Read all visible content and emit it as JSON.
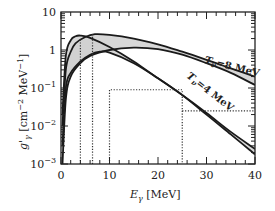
{
  "chart_data": {
    "type": "line",
    "title": "",
    "xlabel": "E_γ [MeV]",
    "ylabel": "g'_γ [cm^-2 MeV^-1]",
    "xlim": [
      0,
      40
    ],
    "ylim": [
      0.001,
      10
    ],
    "yscale": "log",
    "grid": false,
    "legend": "none (inline band labels)",
    "x_ticks": [
      "0",
      "10",
      "20",
      "30",
      "40"
    ],
    "y_ticks": [
      "10^-3",
      "10^-2",
      "10^-1",
      "1",
      "10"
    ],
    "series": [
      {
        "name": "T_ν=8 MeV band",
        "label": "T_ν=8 MeV",
        "fill": "#d0d0d0",
        "upper": [
          [
            0.3,
            0.01
          ],
          [
            1,
            0.3
          ],
          [
            2,
            0.9
          ],
          [
            3,
            1.5
          ],
          [
            5,
            2.2
          ],
          [
            7,
            2.6
          ],
          [
            10,
            2.5
          ],
          [
            15,
            2.0
          ],
          [
            20,
            1.4
          ],
          [
            25,
            0.9
          ],
          [
            30,
            0.55
          ],
          [
            35,
            0.33
          ],
          [
            40,
            0.2
          ]
        ],
        "lower": [
          [
            0.3,
            0.001
          ],
          [
            1,
            0.05
          ],
          [
            2,
            0.2
          ],
          [
            4,
            0.45
          ],
          [
            6,
            0.7
          ],
          [
            10,
            1.0
          ],
          [
            15,
            1.15
          ],
          [
            20,
            1.05
          ],
          [
            25,
            0.75
          ],
          [
            30,
            0.45
          ],
          [
            35,
            0.25
          ],
          [
            40,
            0.12
          ]
        ]
      },
      {
        "name": "T_ν=4 MeV band",
        "label": "T_ν=4 MeV",
        "fill": "#d0d0d0",
        "upper": [
          [
            0.3,
            0.02
          ],
          [
            1,
            0.7
          ],
          [
            2,
            1.8
          ],
          [
            3,
            2.3
          ],
          [
            4,
            2.4
          ],
          [
            6,
            2.1
          ],
          [
            10,
            1.2
          ],
          [
            15,
            0.5
          ],
          [
            20,
            0.18
          ],
          [
            25,
            0.065
          ],
          [
            30,
            0.022
          ],
          [
            35,
            0.007
          ],
          [
            40,
            0.0025
          ]
        ],
        "lower": [
          [
            0.3,
            0.003
          ],
          [
            1,
            0.1
          ],
          [
            2,
            0.25
          ],
          [
            4,
            0.5
          ],
          [
            6,
            0.75
          ],
          [
            8,
            0.9
          ],
          [
            10,
            0.85
          ],
          [
            15,
            0.45
          ],
          [
            20,
            0.18
          ],
          [
            25,
            0.065
          ],
          [
            30,
            0.02
          ],
          [
            35,
            0.006
          ],
          [
            40,
            0.0018
          ]
        ]
      }
    ],
    "dotted_lines": [
      {
        "points": [
          [
            4,
            0.001
          ],
          [
            4,
            2.0
          ]
        ]
      },
      {
        "points": [
          [
            6.5,
            0.001
          ],
          [
            6.5,
            2.6
          ]
        ]
      },
      {
        "points": [
          [
            10,
            0.001
          ],
          [
            10,
            0.09
          ],
          [
            25,
            0.09
          ],
          [
            25,
            0.001
          ]
        ]
      },
      {
        "points": [
          [
            25,
            0.025
          ],
          [
            40,
            0.025
          ]
        ]
      }
    ],
    "annotations": [
      {
        "text": "T_ν=8 MeV",
        "x": 32,
        "y": 0.35,
        "rotation": 14
      },
      {
        "text": "T_ν=4 MeV",
        "x": 29,
        "y": 0.05,
        "rotation": 38
      }
    ]
  },
  "axes": {
    "x_title_main": "E",
    "x_title_sub": "γ",
    "x_title_unit": " [MeV]",
    "y_title_main": "g'",
    "y_title_sub": "γ",
    "y_title_unit": " [cm",
    "y_title_exp1": "−2",
    "y_title_mid": " MeV",
    "y_title_exp2": "−1",
    "y_title_end": "]"
  },
  "labels": {
    "band8_T": "T",
    "band8_sub": "ν",
    "band8_rest": "=8 MeV",
    "band4_T": "T",
    "band4_sub": "ν",
    "band4_rest": "=4 MeV"
  }
}
